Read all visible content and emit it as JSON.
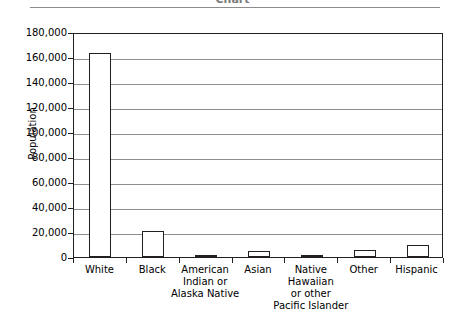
{
  "title": {
    "text": "Chart",
    "cropped": true
  },
  "chart_data": {
    "type": "bar",
    "title": "Chart",
    "xlabel": "",
    "ylabel": "Population",
    "categories": [
      "White",
      "Black",
      "American\nIndian or\nAlaska Native",
      "Asian",
      "Native\nHawaiian\nor other\nPacific Islander",
      "Other",
      "Hispanic"
    ],
    "values": [
      163000,
      21000,
      1300,
      4800,
      1500,
      6000,
      10000
    ],
    "ylim": [
      0,
      180000
    ],
    "ytick_values": [
      0,
      20000,
      40000,
      60000,
      80000,
      100000,
      120000,
      140000,
      160000,
      180000
    ],
    "ytick_labels": [
      "180,000",
      "160,000",
      "140,000",
      "120,000",
      "100,000",
      "80,000",
      "60,000",
      "40,000",
      "20,000",
      "0"
    ],
    "grid": true,
    "legend": false,
    "bar_fill": "#ffffff",
    "bar_stroke": "#231f20",
    "grid_color": "#8e8e8e"
  }
}
